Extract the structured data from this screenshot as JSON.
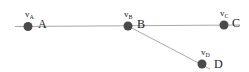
{
  "diagram": {
    "nodes": [
      {
        "id": "A",
        "label": "A",
        "var": "v",
        "sub": "A",
        "x": 28,
        "y": 26
      },
      {
        "id": "B",
        "label": "B",
        "var": "v",
        "sub": "B",
        "x": 128,
        "y": 26
      },
      {
        "id": "C",
        "label": "C",
        "var": "v",
        "sub": "C",
        "x": 224,
        "y": 25
      },
      {
        "id": "D",
        "label": "D",
        "var": "v",
        "sub": "D",
        "x": 202,
        "y": 64
      }
    ],
    "edges": [
      {
        "from": "A",
        "to": "B"
      },
      {
        "from": "B",
        "to": "C"
      },
      {
        "from": "B",
        "to": "D"
      }
    ],
    "colors": {
      "node": "#4a4a4a",
      "edge": "#a8a8a8",
      "text": "#222222"
    }
  }
}
